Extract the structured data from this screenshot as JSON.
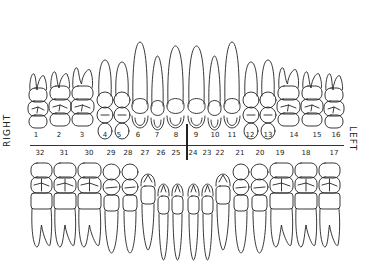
{
  "labels": {
    "right": "RIGHT",
    "left": "LEFT"
  },
  "upper_numbers": [
    {
      "n": "1",
      "x": 36
    },
    {
      "n": "2",
      "x": 59
    },
    {
      "n": "3",
      "x": 82
    },
    {
      "n": "4",
      "x": 105
    },
    {
      "n": "5",
      "x": 119
    },
    {
      "n": "6",
      "x": 138
    },
    {
      "n": "7",
      "x": 157
    },
    {
      "n": "8",
      "x": 176
    },
    {
      "n": "9",
      "x": 196
    },
    {
      "n": "10",
      "x": 215
    },
    {
      "n": "11",
      "x": 232
    },
    {
      "n": "12",
      "x": 250
    },
    {
      "n": "13",
      "x": 268
    },
    {
      "n": "14",
      "x": 294
    },
    {
      "n": "15",
      "x": 317
    },
    {
      "n": "16",
      "x": 336
    }
  ],
  "lower_numbers": [
    {
      "n": "32",
      "x": 40
    },
    {
      "n": "31",
      "x": 64
    },
    {
      "n": "30",
      "x": 89
    },
    {
      "n": "29",
      "x": 111
    },
    {
      "n": "28",
      "x": 128
    },
    {
      "n": "27",
      "x": 145
    },
    {
      "n": "26",
      "x": 161
    },
    {
      "n": "25",
      "x": 176
    },
    {
      "n": "24",
      "x": 193
    },
    {
      "n": "23",
      "x": 207
    },
    {
      "n": "22",
      "x": 220
    },
    {
      "n": "21",
      "x": 240
    },
    {
      "n": "20",
      "x": 260
    },
    {
      "n": "19",
      "x": 280
    },
    {
      "n": "18",
      "x": 306
    },
    {
      "n": "17",
      "x": 334
    }
  ],
  "upper_teeth": [
    {
      "x": 28,
      "w": 20,
      "crown": 38,
      "root": 38,
      "type": "molar"
    },
    {
      "x": 49,
      "w": 22,
      "crown": 40,
      "root": 38,
      "type": "molar"
    },
    {
      "x": 71,
      "w": 23,
      "crown": 40,
      "root": 42,
      "type": "molar"
    },
    {
      "x": 97,
      "w": 16,
      "crown": 34,
      "root": 54,
      "type": "premolar"
    },
    {
      "x": 114,
      "w": 16,
      "crown": 34,
      "root": 52,
      "type": "premolar"
    },
    {
      "x": 131,
      "w": 18,
      "crown": 30,
      "root": 70,
      "type": "canine"
    },
    {
      "x": 150,
      "w": 15,
      "crown": 28,
      "root": 58,
      "type": "incisor"
    },
    {
      "x": 166,
      "w": 19,
      "crown": 30,
      "root": 66,
      "type": "incisor"
    },
    {
      "x": 187,
      "w": 19,
      "crown": 30,
      "root": 66,
      "type": "incisor"
    },
    {
      "x": 207,
      "w": 15,
      "crown": 28,
      "root": 58,
      "type": "incisor"
    },
    {
      "x": 223,
      "w": 18,
      "crown": 30,
      "root": 70,
      "type": "canine"
    },
    {
      "x": 243,
      "w": 16,
      "crown": 34,
      "root": 52,
      "type": "premolar"
    },
    {
      "x": 260,
      "w": 16,
      "crown": 34,
      "root": 54,
      "type": "premolar"
    },
    {
      "x": 277,
      "w": 23,
      "crown": 40,
      "root": 42,
      "type": "molar"
    },
    {
      "x": 301,
      "w": 22,
      "crown": 40,
      "root": 38,
      "type": "molar"
    },
    {
      "x": 324,
      "w": 20,
      "crown": 38,
      "root": 38,
      "type": "molar"
    }
  ],
  "lower_teeth": [
    {
      "x": 31,
      "w": 21,
      "type": "molar"
    },
    {
      "x": 54,
      "w": 22,
      "type": "molar"
    },
    {
      "x": 78,
      "w": 23,
      "type": "molar"
    },
    {
      "x": 103,
      "w": 17,
      "type": "premolar"
    },
    {
      "x": 122,
      "w": 16,
      "type": "premolar"
    },
    {
      "x": 140,
      "w": 16,
      "type": "canine"
    },
    {
      "x": 157,
      "w": 13,
      "type": "incisor"
    },
    {
      "x": 171,
      "w": 13,
      "type": "incisor"
    },
    {
      "x": 187,
      "w": 13,
      "type": "incisor"
    },
    {
      "x": 201,
      "w": 13,
      "type": "incisor"
    },
    {
      "x": 215,
      "w": 16,
      "type": "canine"
    },
    {
      "x": 233,
      "w": 16,
      "type": "premolar"
    },
    {
      "x": 251,
      "w": 17,
      "type": "premolar"
    },
    {
      "x": 270,
      "w": 23,
      "type": "molar"
    },
    {
      "x": 295,
      "w": 22,
      "type": "molar"
    },
    {
      "x": 319,
      "w": 21,
      "type": "molar"
    }
  ]
}
